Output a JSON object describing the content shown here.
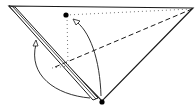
{
  "diagram": {
    "type": "origami-fold-step",
    "colors": {
      "line": "#1a1a1a",
      "background": "#ffffff",
      "guide": "#555555"
    },
    "elements": {
      "paper": "triangle",
      "folded_flap": "left edge strip",
      "reference_point_top": "dot",
      "reference_point_bottom": "dot",
      "fold_line": "dashed valley fold",
      "guide_lines": "dotted",
      "arrows": [
        "fold bottom point up to top dot",
        "fold left flap"
      ]
    }
  }
}
